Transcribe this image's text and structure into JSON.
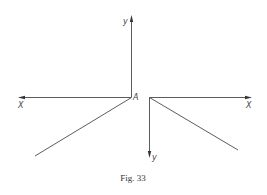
{
  "figure": {
    "caption": "Fig. 33",
    "point_label": "A",
    "left_axes": {
      "y_label": "y",
      "x_label": "X",
      "origin": [
        131,
        97
      ],
      "y_end": [
        132,
        16
      ],
      "x_end": [
        18,
        97
      ],
      "oblique_end": [
        35,
        156
      ]
    },
    "right_axes": {
      "x_label": "X",
      "y_label": "y",
      "origin": [
        149,
        97
      ],
      "x_end": [
        252,
        97
      ],
      "y_end": [
        149,
        158
      ],
      "oblique_end": [
        238,
        150
      ]
    },
    "colors": {
      "line": "#4a4a4a",
      "text": "#444444",
      "background": "#ffffff"
    }
  }
}
